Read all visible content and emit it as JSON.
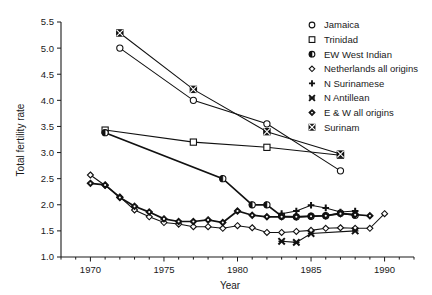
{
  "chart_data": {
    "type": "line",
    "title": "",
    "xlabel": "Year",
    "ylabel": "Total fertility rate",
    "xlim": [
      1968,
      1992
    ],
    "ylim": [
      1.0,
      5.5
    ],
    "xticks": [
      1970,
      1975,
      1980,
      1985,
      1990
    ],
    "xticklabels": [
      "1970",
      "1975",
      "1980",
      "1985",
      "1990"
    ],
    "yticks": [
      1.0,
      1.5,
      2.0,
      2.5,
      3.0,
      3.5,
      4.0,
      4.5,
      5.0,
      5.5
    ],
    "yticklabels": [
      "1.0",
      "1.5",
      "2.0",
      "2.5",
      "3.0",
      "3.5",
      "4.0",
      "4.5",
      "5.0",
      "5.5"
    ],
    "grid": false,
    "minor_xticks": true,
    "legend_position": "top-right",
    "series": [
      {
        "name": "Jamaica",
        "marker": "circle-open",
        "x": [
          1972,
          1977,
          1982,
          1987
        ],
        "y": [
          5.0,
          4.0,
          3.55,
          2.65
        ]
      },
      {
        "name": "Trinidad",
        "marker": "square-open",
        "x": [
          1971,
          1977,
          1982,
          1987
        ],
        "y": [
          3.43,
          3.2,
          3.1,
          2.95
        ]
      },
      {
        "name": "EW West Indian",
        "marker": "circle-half",
        "x": [
          1971,
          1979,
          1981,
          1982,
          1983,
          1984,
          1985,
          1986,
          1987,
          1988
        ],
        "y": [
          3.38,
          2.5,
          2.0,
          2.0,
          1.78,
          1.77,
          1.78,
          1.79,
          1.84,
          1.8
        ]
      },
      {
        "name": "Netherlands all origins",
        "marker": "diamond-open",
        "x": [
          1970,
          1971,
          1972,
          1973,
          1974,
          1975,
          1976,
          1977,
          1978,
          1979,
          1980,
          1981,
          1982,
          1983,
          1984,
          1985,
          1986,
          1987,
          1988,
          1989,
          1990
        ],
        "y": [
          2.57,
          2.37,
          2.15,
          1.9,
          1.77,
          1.66,
          1.63,
          1.58,
          1.58,
          1.55,
          1.6,
          1.56,
          1.47,
          1.47,
          1.49,
          1.51,
          1.55,
          1.56,
          1.55,
          1.55,
          1.83
        ]
      },
      {
        "name": "N Surinamese",
        "marker": "plus",
        "x": [
          1983,
          1984,
          1985,
          1986,
          1987,
          1988
        ],
        "y": [
          1.83,
          1.88,
          1.99,
          1.94,
          1.86,
          1.88
        ]
      },
      {
        "name": "N Antillean",
        "marker": "cross",
        "x": [
          1983,
          1984,
          1985,
          1988
        ],
        "y": [
          1.3,
          1.28,
          1.45,
          1.5
        ]
      },
      {
        "name": "E & W all origins",
        "marker": "diamond-dot",
        "x": [
          1970,
          1971,
          1972,
          1973,
          1974,
          1975,
          1976,
          1977,
          1978,
          1979,
          1980,
          1981,
          1982,
          1983,
          1984,
          1985,
          1986,
          1987,
          1988,
          1989
        ],
        "y": [
          2.41,
          2.38,
          2.14,
          1.97,
          1.86,
          1.73,
          1.68,
          1.68,
          1.71,
          1.66,
          1.88,
          1.8,
          1.77,
          1.77,
          1.77,
          1.78,
          1.79,
          1.83,
          1.81,
          1.79
        ]
      },
      {
        "name": "Surinam",
        "marker": "square-crossed",
        "x": [
          1972,
          1977,
          1982,
          1987
        ],
        "y": [
          5.29,
          4.21,
          3.4,
          2.97
        ]
      }
    ]
  },
  "legend": {
    "items": [
      {
        "label": "Jamaica",
        "marker": "circle-open"
      },
      {
        "label": "Trinidad",
        "marker": "square-open"
      },
      {
        "label": "EW West Indian",
        "marker": "circle-half"
      },
      {
        "label": "Netherlands all origins",
        "marker": "diamond-open"
      },
      {
        "label": "N Surinamese",
        "marker": "plus"
      },
      {
        "label": "N Antillean",
        "marker": "cross"
      },
      {
        "label": "E & W all origins",
        "marker": "diamond-dot"
      },
      {
        "label": "Surinam",
        "marker": "square-crossed"
      }
    ]
  },
  "colors": {
    "ink": "#111111",
    "background": "#ffffff"
  }
}
